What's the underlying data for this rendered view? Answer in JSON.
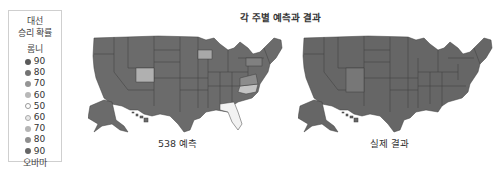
{
  "legend": {
    "title_line1": "대선",
    "title_line2": "승리 확률",
    "top_candidate": "롬니",
    "bottom_candidate": "오바마",
    "items": [
      {
        "label": "90",
        "color": "#5a5a5a"
      },
      {
        "label": "80",
        "color": "#737373"
      },
      {
        "label": "70",
        "color": "#959595"
      },
      {
        "label": "60",
        "color": "#b8b8b8"
      },
      {
        "label": "50",
        "color": "#ffffff"
      },
      {
        "label": "60",
        "color": "#d8d8d8"
      },
      {
        "label": "70",
        "color": "#b5b5b5"
      },
      {
        "label": "80",
        "color": "#8f8f8f"
      },
      {
        "label": "90",
        "color": "#666666"
      }
    ]
  },
  "title": "각 주별 예측과 결과",
  "maps": [
    {
      "label": "538 예측",
      "base_color": "#6b6b6b",
      "highlighted_states": [
        {
          "state": "Colorado",
          "color": "#b0b0b0"
        },
        {
          "state": "Iowa",
          "color": "#a8a8a8"
        },
        {
          "state": "North Carolina",
          "color": "#c4c4c4"
        },
        {
          "state": "Florida",
          "color": "#f2f2f2"
        },
        {
          "state": "Virginia",
          "color": "#8c8c8c"
        },
        {
          "state": "Pennsylvania",
          "color": "#808080"
        }
      ]
    },
    {
      "label": "실제 결과",
      "base_color": "#666666",
      "highlighted_states": [
        {
          "state": "Colorado",
          "color": "#777777"
        },
        {
          "state": "New Mexico",
          "color": "#777777"
        }
      ]
    }
  ]
}
